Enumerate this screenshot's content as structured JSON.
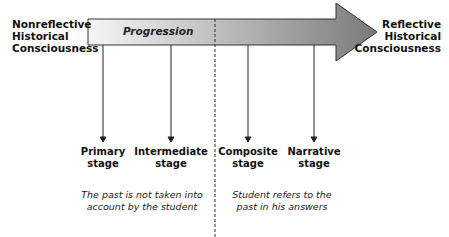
{
  "diagram": {
    "left_label": [
      "Nonreflective",
      "Historical",
      "Consciousness"
    ],
    "right_label": [
      "Reflective",
      "Historical",
      "Consciousness"
    ],
    "arrow_label": "Progression",
    "stages": [
      {
        "line1": "Primary",
        "line2": "stage"
      },
      {
        "line1": "Intermediate",
        "line2": "stage"
      },
      {
        "line1": "Composite",
        "line2": "stage"
      },
      {
        "line1": "Narrative",
        "line2": "stage"
      }
    ],
    "notes": {
      "left": [
        "The past is not taken into",
        "account by the student"
      ],
      "right": [
        "Student refers to the",
        "past in his answers"
      ]
    },
    "colors": {
      "arrow_start": "#f4f4f4",
      "arrow_end": "#808080",
      "stroke": "#333333"
    }
  }
}
